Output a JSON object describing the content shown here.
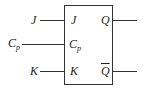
{
  "diagram": {
    "inputs": [
      {
        "external": "J",
        "internal": "J"
      },
      {
        "external": "C",
        "external_sub": "p",
        "internal": "C",
        "internal_sub": "p"
      },
      {
        "external": "K",
        "internal": "K"
      }
    ],
    "outputs": [
      {
        "label": "Q"
      },
      {
        "label": "Q",
        "overline": true
      }
    ]
  }
}
